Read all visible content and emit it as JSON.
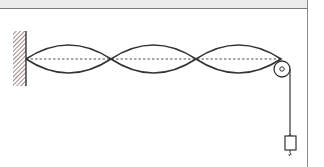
{
  "diagram": {
    "loops": 3,
    "nodes_x": [
      26,
      111,
      196,
      281
    ],
    "equilibrium_y": 59,
    "amplitude": 14,
    "wall": {
      "x": 13,
      "y": 31,
      "width": 13,
      "height": 55,
      "hatch_color": "#8a6a6a"
    },
    "pulley": {
      "cx": 282,
      "cy": 69,
      "r": 8,
      "axle_r": 2.2
    },
    "hanging_string": {
      "x": 290,
      "y1": 69,
      "y2": 136
    },
    "weight": {
      "x": 285,
      "y": 136,
      "width": 11,
      "height": 14
    },
    "colors": {
      "line": "#333333",
      "dash": "#555555",
      "border": "#8a8a8a",
      "band": "#ececec"
    }
  }
}
